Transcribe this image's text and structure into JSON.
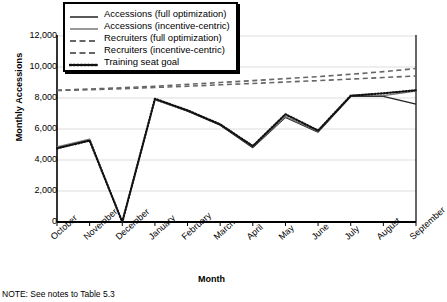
{
  "chart_data": {
    "type": "line",
    "title": "",
    "xlabel": "Month",
    "ylabel": "Monthly Accessions",
    "categories": [
      "October",
      "November",
      "December",
      "January",
      "February",
      "March",
      "April",
      "May",
      "June",
      "July",
      "August",
      "September"
    ],
    "ylim": [
      0,
      12000
    ],
    "ytick_labels": [
      "0",
      "2,000",
      "4,000",
      "6,000",
      "8,000",
      "10,000",
      "12,000"
    ],
    "ytick_values": [
      0,
      2000,
      4000,
      6000,
      8000,
      10000,
      12000
    ],
    "grid": true,
    "legend_position": "top-left",
    "series": [
      {
        "name": "Accessions (full optimization)",
        "style": "solid",
        "color": "#222222",
        "values": [
          4800,
          5300,
          0,
          7900,
          7150,
          6250,
          4800,
          6750,
          5800,
          8100,
          8100,
          7600
        ]
      },
      {
        "name": "Accessions (incentive-centric)",
        "style": "solid",
        "color": "#777777",
        "values": [
          4850,
          5350,
          0,
          7900,
          7200,
          6300,
          4850,
          6800,
          5850,
          8150,
          8150,
          8450
        ]
      },
      {
        "name": "Recruiters (full optimization)",
        "style": "dashed",
        "color": "#666666",
        "values": [
          8500,
          8580,
          8660,
          8760,
          8880,
          9000,
          9120,
          9250,
          9380,
          9530,
          9700,
          9900
        ]
      },
      {
        "name": "Recruiters (incentive-centric)",
        "style": "dashed",
        "color": "#666666",
        "values": [
          8480,
          8540,
          8600,
          8680,
          8760,
          8850,
          8940,
          9030,
          9120,
          9220,
          9320,
          9420
        ]
      },
      {
        "name": "Training seat goal",
        "style": "dotted",
        "color": "#111111",
        "values": [
          4750,
          5250,
          0,
          7950,
          7200,
          6300,
          4900,
          6950,
          5900,
          8150,
          8300,
          8500
        ]
      }
    ]
  },
  "legend": {
    "items": [
      {
        "label": "Accessions (full optimization)",
        "key": "solid-dark-key"
      },
      {
        "label": "Accessions (incentive-centric)",
        "key": "solid-gray-key"
      },
      {
        "label": "Recruiters (full optimization)",
        "key": "dashed-key"
      },
      {
        "label": "Recruiters (incentive-centric)",
        "key": "dashed-key"
      },
      {
        "label": "Training seat goal",
        "key": "dotted-key"
      }
    ]
  },
  "footnote": {
    "text": "NOTE: See notes to Table 5.3"
  }
}
